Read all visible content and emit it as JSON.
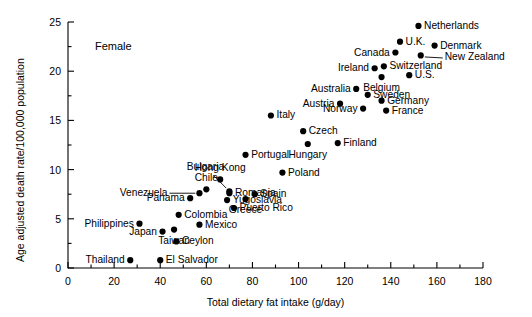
{
  "chart_data": {
    "type": "scatter",
    "title": "",
    "annotation": "Female",
    "xlabel": "Total dietary fat intake (g/day)",
    "ylabel": "Age adjusted death rate/100,000 population",
    "xlim": [
      0,
      180
    ],
    "ylim": [
      0,
      25
    ],
    "xticks": [
      0,
      20,
      40,
      60,
      80,
      100,
      120,
      140,
      160,
      180
    ],
    "yticks": [
      0,
      5,
      10,
      15,
      20,
      25
    ],
    "xminorticks": [
      10,
      30,
      50,
      70,
      90,
      110,
      130,
      150,
      170
    ],
    "yminorticks": [
      2.5,
      7.5,
      12.5,
      17.5,
      22.5
    ],
    "grid": false,
    "legend": "none",
    "points": [
      {
        "label": "Netherlands",
        "x": 152,
        "y": 24.6,
        "label_pos": "right"
      },
      {
        "label": "U.K.",
        "x": 144,
        "y": 23.0,
        "label_pos": "right"
      },
      {
        "label": "Denmark",
        "x": 159,
        "y": 22.6,
        "label_pos": "right"
      },
      {
        "label": "Canada",
        "x": 142,
        "y": 21.9,
        "label_pos": "left"
      },
      {
        "label": "New Zealand",
        "x": 153,
        "y": 21.6,
        "label_pos": "leader-right"
      },
      {
        "label": "Switzerland",
        "x": 137,
        "y": 20.5,
        "label_pos": "right"
      },
      {
        "label": "Ireland",
        "x": 133,
        "y": 20.3,
        "label_pos": "left"
      },
      {
        "label": "U.S.",
        "x": 148,
        "y": 19.6,
        "label_pos": "right"
      },
      {
        "label": "Belgium",
        "x": 136,
        "y": 19.4,
        "label_pos": "below"
      },
      {
        "label": "Australia",
        "x": 125,
        "y": 18.2,
        "label_pos": "left"
      },
      {
        "label": "Sweden",
        "x": 130,
        "y": 17.6,
        "label_pos": "right"
      },
      {
        "label": "Germany",
        "x": 136,
        "y": 17.0,
        "label_pos": "right"
      },
      {
        "label": "Austria",
        "x": 118,
        "y": 16.7,
        "label_pos": "left"
      },
      {
        "label": "Norway",
        "x": 128,
        "y": 16.2,
        "label_pos": "left"
      },
      {
        "label": "France",
        "x": 138,
        "y": 16.0,
        "label_pos": "right"
      },
      {
        "label": "Italy",
        "x": 88,
        "y": 15.5,
        "label_pos": "right"
      },
      {
        "label": "Czech",
        "x": 102,
        "y": 13.9,
        "label_pos": "right"
      },
      {
        "label": "Hungary",
        "x": 104,
        "y": 12.6,
        "label_pos": "below"
      },
      {
        "label": "Finland",
        "x": 117,
        "y": 12.7,
        "label_pos": "right"
      },
      {
        "label": "Portugal",
        "x": 77,
        "y": 11.5,
        "label_pos": "right"
      },
      {
        "label": "Poland",
        "x": 93,
        "y": 9.7,
        "label_pos": "right"
      },
      {
        "label": "Hong Kong",
        "x": 66,
        "y": 9.0,
        "label_pos": "above"
      },
      {
        "label": "Bulgaria",
        "x": 70,
        "y": 7.8,
        "label_pos": "leader-upleft"
      },
      {
        "label": "Chile",
        "x": 60,
        "y": 8.0,
        "label_pos": "above"
      },
      {
        "label": "Romania",
        "x": 70,
        "y": 7.6,
        "label_pos": "right"
      },
      {
        "label": "Spain",
        "x": 81,
        "y": 7.5,
        "label_pos": "right"
      },
      {
        "label": "Venezuela",
        "x": 57,
        "y": 7.6,
        "label_pos": "leader-left"
      },
      {
        "label": "Panama",
        "x": 53,
        "y": 7.1,
        "label_pos": "left"
      },
      {
        "label": "Yugoslavia",
        "x": 69,
        "y": 6.9,
        "label_pos": "right"
      },
      {
        "label": "Greece",
        "x": 77,
        "y": 7.0,
        "label_pos": "below"
      },
      {
        "label": "Puerto Rico",
        "x": 72,
        "y": 6.1,
        "label_pos": "right"
      },
      {
        "label": "Colombia",
        "x": 48,
        "y": 5.4,
        "label_pos": "right"
      },
      {
        "label": "Philippines",
        "x": 31,
        "y": 4.5,
        "label_pos": "left"
      },
      {
        "label": "Mexico",
        "x": 57,
        "y": 4.4,
        "label_pos": "right"
      },
      {
        "label": "Japan",
        "x": 41,
        "y": 3.7,
        "label_pos": "left"
      },
      {
        "label": "Taiwan",
        "x": 46,
        "y": 3.9,
        "label_pos": "below"
      },
      {
        "label": "Ceylon",
        "x": 47,
        "y": 2.7,
        "label_pos": "right"
      },
      {
        "label": "Thailand",
        "x": 27,
        "y": 0.8,
        "label_pos": "left"
      },
      {
        "label": "El Salvador",
        "x": 40,
        "y": 0.8,
        "label_pos": "right"
      }
    ]
  }
}
